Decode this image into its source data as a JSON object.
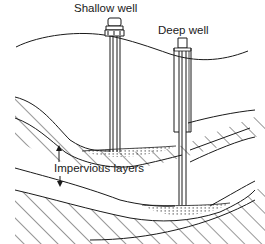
{
  "diagram": {
    "type": "cross-section",
    "labels": {
      "shallow_well": "Shallow well",
      "deep_well": "Deep well",
      "impervious_layers": "Impervious layers"
    },
    "elements": [
      {
        "id": "ground-surface",
        "kind": "curve"
      },
      {
        "id": "shallow-well",
        "kind": "well",
        "depth": "reaches upper aquifer"
      },
      {
        "id": "deep-well",
        "kind": "well",
        "depth": "reaches lower aquifer"
      },
      {
        "id": "upper-impervious-layer",
        "kind": "hatched-layer"
      },
      {
        "id": "lower-impervious-layer",
        "kind": "hatched-layer"
      },
      {
        "id": "upper-aquifer",
        "kind": "dotted-water-lens"
      },
      {
        "id": "lower-aquifer",
        "kind": "dotted-water-lens"
      }
    ],
    "arrows": [
      {
        "from": "impervious_layers",
        "to": "upper-impervious-layer",
        "direction": "up"
      },
      {
        "from": "impervious_layers",
        "to": "lower-impervious-layer",
        "direction": "down"
      }
    ],
    "colors": {
      "ink": "#1a1a1a",
      "background": "#ffffff"
    }
  }
}
